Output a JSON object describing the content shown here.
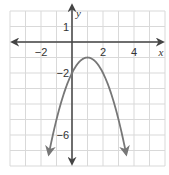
{
  "chart_data": {
    "type": "line",
    "title": "",
    "xlabel": "x",
    "ylabel": "y",
    "xlim": [
      -4,
      6
    ],
    "ylim": [
      -8,
      2
    ],
    "grid": true,
    "x_ticks": [
      {
        "value": -2,
        "label": "−2"
      },
      {
        "value": 2,
        "label": "2"
      },
      {
        "value": 4,
        "label": "4"
      }
    ],
    "y_ticks": [
      {
        "value": 1,
        "label": "1"
      },
      {
        "value": -2,
        "label": "−2"
      },
      {
        "value": -6,
        "label": "−6"
      }
    ],
    "series": [
      {
        "name": "parabola",
        "equation": "y = -(x - 1)^2 - 1",
        "vertex": [
          1,
          -1
        ],
        "y_intercept": [
          0,
          -2
        ],
        "x": [
          -1.5,
          -1,
          0,
          1,
          2,
          3,
          3.5
        ],
        "y": [
          -7.25,
          -5,
          -2,
          -1,
          -2,
          -5,
          -7.25
        ],
        "color": "#777777",
        "arrows": "both ends"
      }
    ]
  },
  "colors": {
    "grid": "#d9d9d9",
    "axis": "#444444",
    "curve": "#777777"
  }
}
